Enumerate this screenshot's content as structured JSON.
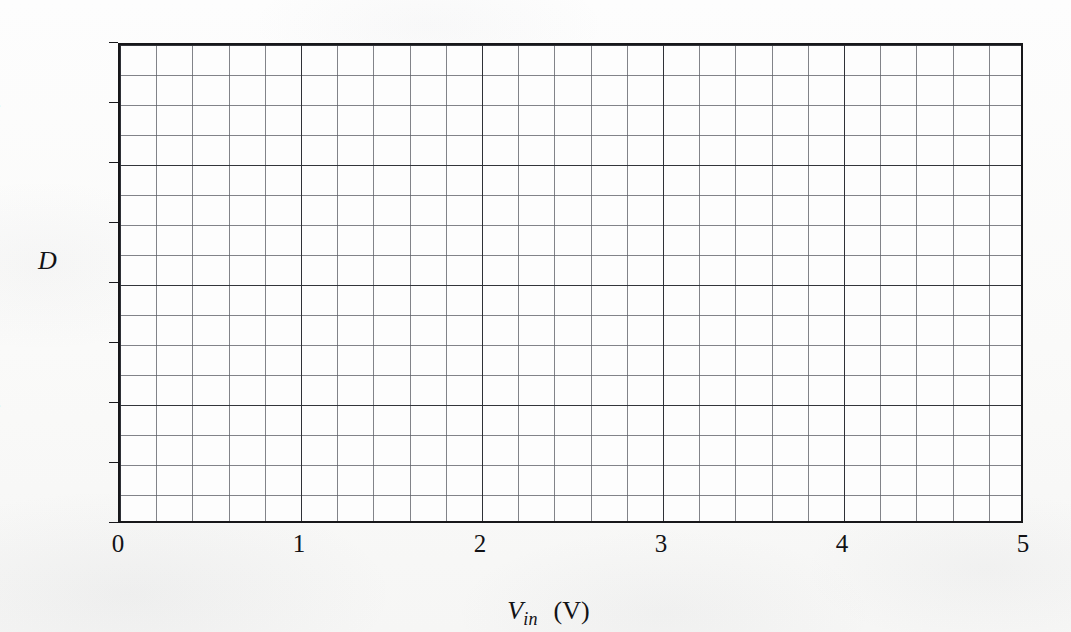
{
  "figure": {
    "kind": "blank-plot-grid",
    "y_axis": {
      "title": "D",
      "tick_labels": [
        "0",
        "32",
        "64",
        "96",
        "128",
        "160",
        "192",
        "224",
        "256"
      ],
      "min": 0,
      "max": 256,
      "tick_step": 32,
      "minor_divisions": 16
    },
    "x_axis": {
      "title_variable": "V",
      "title_subscript": "in",
      "title_unit": "(V)",
      "tick_labels": [
        "0",
        "1",
        "2",
        "3",
        "4",
        "5"
      ],
      "min": 0,
      "max": 5,
      "tick_step": 1,
      "minor_divisions": 25
    },
    "colors": {
      "frame": "#17171a",
      "grid_minor": "#5f6168",
      "grid_major": "#2a2c30",
      "plot_background": "#fdfdfd",
      "page_background": "#fbfbfa",
      "text": "#121215"
    }
  },
  "chart_data": {
    "type": "line",
    "title": "",
    "subtitle": "",
    "xlabel": "Vin (V)",
    "ylabel": "D",
    "xlim": [
      0,
      5
    ],
    "ylim": [
      0,
      256
    ],
    "xticks": [
      0,
      1,
      2,
      3,
      4,
      5
    ],
    "yticks": [
      0,
      32,
      64,
      96,
      128,
      160,
      192,
      224,
      256
    ],
    "xtick_labels": [
      "0",
      "1",
      "2",
      "3",
      "4",
      "5"
    ],
    "ytick_labels": [
      "0",
      "32",
      "64",
      "96",
      "128",
      "160",
      "192",
      "224",
      "256"
    ],
    "grid": true,
    "grid_minor_x_divisions": 25,
    "grid_minor_y_divisions": 16,
    "legend": null,
    "legend_position": "none",
    "annotations": [],
    "series": [],
    "note": "Blank plotting grid — no data series are drawn in the figure."
  }
}
